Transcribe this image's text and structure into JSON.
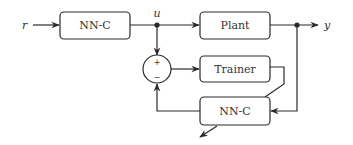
{
  "diagram": {
    "type": "neural network control block diagram",
    "signals": {
      "reference": "r",
      "control": "u",
      "output": "y"
    },
    "blocks": {
      "controller_main": "NN-C",
      "plant": "Plant",
      "trainer": "Trainer",
      "controller_copy": "NN-C"
    },
    "summing_junction": {
      "plus": "+",
      "minus": "−"
    },
    "colors": {
      "stroke": "#2a2a2a",
      "text": "#333333",
      "plus_accent": "#2e9e3e"
    }
  }
}
